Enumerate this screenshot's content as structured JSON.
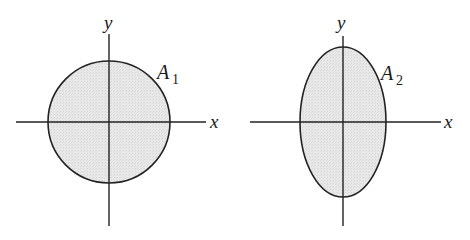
{
  "figures": [
    {
      "id": "left",
      "shape": "circle",
      "label_main": "A",
      "label_sub": "1",
      "x_axis_label": "x",
      "y_axis_label": "y",
      "fill_color": "#e6e6e6",
      "stroke_color": "#222222"
    },
    {
      "id": "right",
      "shape": "ellipse (vertical major axis)",
      "label_main": "A",
      "label_sub": "2",
      "x_axis_label": "x",
      "y_axis_label": "y",
      "fill_color": "#e6e6e6",
      "stroke_color": "#222222"
    }
  ]
}
